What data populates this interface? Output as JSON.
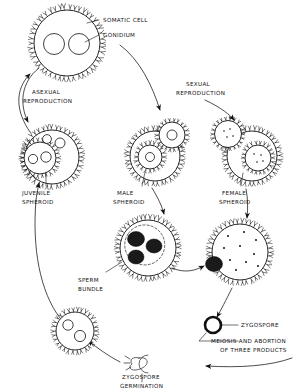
{
  "figure": {
    "background_color": "#ffffff",
    "ink_color": "#111111",
    "width": 301,
    "height": 392
  },
  "labels": {
    "somatic_cell": "SOMATIC CELL",
    "gonidium": "GONIDIUM",
    "asexual_reproduction_line1": "ASEXUAL",
    "asexual_reproduction_line2": "REPRODUCTION",
    "sexual_reproduction_line1": "SEXUAL",
    "sexual_reproduction_line2": "REPRODUCTION",
    "juvenile_spheroid_line1": "JUVENILE",
    "juvenile_spheroid_line2": "SPHEROID",
    "male_spheroid_line1": "MALE",
    "male_spheroid_line2": "SPHEROID",
    "female_spheroid_line1": "FEMALE",
    "female_spheroid_line2": "SPHEROID",
    "sperm_bundle_line1": "SPERM",
    "sperm_bundle_line2": "BUNDLE",
    "zygospore": "ZYGOSPORE",
    "meiosis_line1": "MEIOSIS AND ABORTION",
    "meiosis_line2": "OF THREE PRODUCTS",
    "zygospore_germination_line1": "ZYGOSPORE",
    "zygospore_germination_line2": "GERMINATION"
  },
  "structures": {
    "adult_spheroid": "adult-spheroid-with-two-gonidia",
    "juvenile_spheroid": "juvenile-spheroid-inside-parent",
    "male_spheroid": "male-spheroid",
    "female_spheroid": "female-spheroid",
    "sperm_bundle_spheroid": "spheroid-releasing-sperm-bundles",
    "fertilized_female_spheroid": "female-spheroid-with-eggs-and-sperm-bundle",
    "zygospore": "zygospore-thick-walled-ring",
    "germinating_zygospore": "germinating-zygospore",
    "new_juvenile": "new-juvenile-spheroid"
  }
}
